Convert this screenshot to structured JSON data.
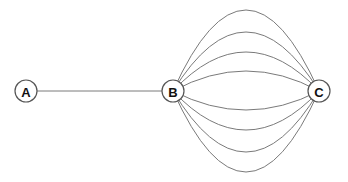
{
  "diagram": {
    "nodes": [
      {
        "id": "A",
        "label": "A"
      },
      {
        "id": "B",
        "label": "B"
      },
      {
        "id": "C",
        "label": "C"
      }
    ],
    "edges": [
      {
        "from": "A",
        "to": "B",
        "count": 1
      },
      {
        "from": "B",
        "to": "C",
        "count": 8
      }
    ]
  }
}
